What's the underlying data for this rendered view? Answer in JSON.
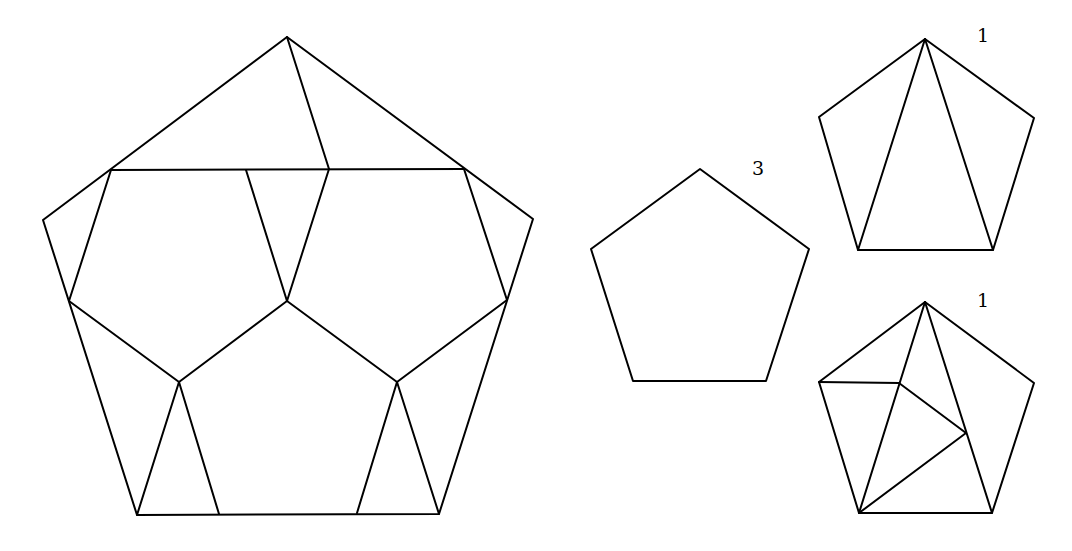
{
  "diagram": {
    "stroke_color": "#000000",
    "background": "#ffffff",
    "figures": [
      {
        "id": "large-pentagon-tiling",
        "label": "",
        "outline": [
          [
            287,
            37
          ],
          [
            533,
            219
          ],
          [
            439,
            514
          ],
          [
            137,
            515
          ],
          [
            43,
            220
          ]
        ],
        "segments": [
          [
            [
              287,
              37
            ],
            [
              329,
              169
            ]
          ],
          [
            [
              111,
              170
            ],
            [
              464,
              169
            ]
          ],
          [
            [
              111,
              170
            ],
            [
              69,
              301
            ]
          ],
          [
            [
              246,
              170
            ],
            [
              287,
              301
            ]
          ],
          [
            [
              329,
              169
            ],
            [
              287,
              301
            ]
          ],
          [
            [
              287,
              301
            ],
            [
              179,
              382
            ]
          ],
          [
            [
              287,
              301
            ],
            [
              397,
              382
            ]
          ],
          [
            [
              69,
              301
            ],
            [
              179,
              382
            ]
          ],
          [
            [
              507,
              300
            ],
            [
              397,
              382
            ]
          ],
          [
            [
              464,
              169
            ],
            [
              507,
              300
            ]
          ],
          [
            [
              179,
              382
            ],
            [
              137,
              515
            ]
          ],
          [
            [
              179,
              382
            ],
            [
              219,
              514
            ]
          ],
          [
            [
              397,
              382
            ],
            [
              357,
              513
            ]
          ],
          [
            [
              397,
              382
            ],
            [
              439,
              514
            ]
          ]
        ]
      },
      {
        "id": "plain-pentagon",
        "label": "3",
        "label_pos": [
          752,
          175
        ],
        "outline": [
          [
            700,
            169
          ],
          [
            809,
            249
          ],
          [
            766,
            381
          ],
          [
            633,
            381
          ],
          [
            591,
            249
          ]
        ],
        "segments": []
      },
      {
        "id": "pentagon-three-triangles",
        "label": "1",
        "label_pos": [
          977,
          42
        ],
        "outline": [
          [
            925,
            39
          ],
          [
            1034,
            118
          ],
          [
            993,
            250
          ],
          [
            858,
            250
          ],
          [
            819,
            117
          ]
        ],
        "segments": [
          [
            [
              925,
              39
            ],
            [
              858,
              250
            ]
          ],
          [
            [
              925,
              39
            ],
            [
              993,
              250
            ]
          ]
        ]
      },
      {
        "id": "pentagon-five-pieces",
        "label": "1",
        "label_pos": [
          977,
          307
        ],
        "outline": [
          [
            925,
            302
          ],
          [
            1034,
            383
          ],
          [
            992,
            513
          ],
          [
            859,
            513
          ],
          [
            819,
            382
          ]
        ],
        "segments": [
          [
            [
              925,
              302
            ],
            [
              859,
              513
            ]
          ],
          [
            [
              925,
              302
            ],
            [
              992,
              513
            ]
          ],
          [
            [
              819,
              382
            ],
            [
              899,
              383
            ]
          ],
          [
            [
              899,
              383
            ],
            [
              966,
              433
            ]
          ],
          [
            [
              966,
              433
            ],
            [
              859,
              513
            ]
          ]
        ]
      }
    ]
  }
}
